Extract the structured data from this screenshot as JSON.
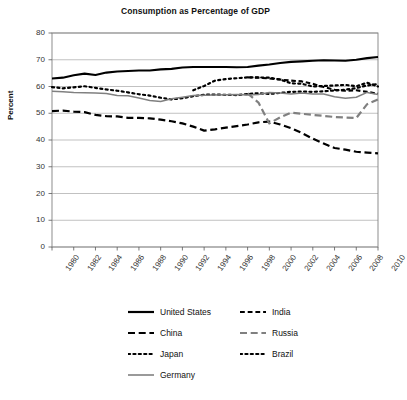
{
  "chart_data": {
    "type": "line",
    "title": "Consumption as Percentage of GDP",
    "xlabel": "",
    "ylabel": "Percent",
    "ylim": [
      0,
      80
    ],
    "ytick_step": 10,
    "yticks": [
      "0",
      "10",
      "20",
      "30",
      "40",
      "50",
      "60",
      "70",
      "80"
    ],
    "xlim": [
      1980,
      2010
    ],
    "xtick_step": 2,
    "xticks": [
      "1980",
      "1982",
      "1984",
      "1986",
      "1988",
      "1990",
      "1992",
      "1994",
      "1996",
      "1998",
      "2000",
      "2002",
      "2004",
      "2006",
      "2008",
      "2010"
    ],
    "grid": "horizontal",
    "legend_position": "below",
    "x": [
      1980,
      1981,
      1982,
      1983,
      1984,
      1985,
      1986,
      1987,
      1988,
      1989,
      1990,
      1991,
      1992,
      1993,
      1994,
      1995,
      1996,
      1997,
      1998,
      1999,
      2000,
      2001,
      2002,
      2003,
      2004,
      2005,
      2006,
      2007,
      2008,
      2009,
      2010
    ],
    "series": [
      {
        "name": "United States",
        "style": "solid",
        "color": "#000000",
        "width": 2.1,
        "values": [
          63.0,
          63.3,
          64.2,
          64.8,
          64.3,
          65.2,
          65.6,
          65.8,
          66.0,
          66.0,
          66.4,
          66.6,
          67.1,
          67.3,
          67.3,
          67.3,
          67.3,
          67.2,
          67.3,
          67.8,
          68.2,
          68.8,
          69.2,
          69.4,
          69.6,
          69.8,
          69.7,
          69.6,
          70.0,
          70.6,
          71.0
        ]
      },
      {
        "name": "India",
        "style": "dashed",
        "color": "#000000",
        "width": 2.1,
        "values": [
          null,
          null,
          null,
          null,
          null,
          null,
          null,
          null,
          null,
          null,
          null,
          null,
          null,
          null,
          null,
          null,
          null,
          null,
          63.4,
          63.3,
          63.0,
          62.6,
          62.2,
          61.9,
          61.0,
          59.8,
          58.8,
          58.4,
          58.6,
          58.0,
          57.3
        ]
      },
      {
        "name": "China",
        "style": "dashed-long",
        "color": "#000000",
        "width": 2.2,
        "values": [
          50.8,
          51.0,
          50.6,
          50.4,
          49.4,
          48.9,
          48.8,
          48.3,
          48.3,
          48.1,
          47.6,
          47.0,
          46.2,
          45.0,
          43.5,
          44.0,
          44.6,
          45.2,
          45.8,
          46.6,
          46.9,
          45.8,
          44.4,
          42.6,
          40.5,
          38.7,
          37.0,
          36.4,
          35.6,
          35.3,
          35.0
        ]
      },
      {
        "name": "Russia",
        "style": "dashed-long",
        "color": "#808080",
        "width": 2.2,
        "values": [
          null,
          null,
          null,
          null,
          null,
          null,
          null,
          null,
          null,
          null,
          null,
          null,
          null,
          null,
          null,
          null,
          null,
          null,
          57.4,
          54.0,
          46.2,
          48.5,
          50.2,
          49.8,
          49.4,
          49.0,
          48.6,
          48.4,
          48.2,
          53.4,
          55.2
        ]
      },
      {
        "name": "Japan",
        "style": "dotted",
        "color": "#000000",
        "width": 2.2,
        "values": [
          59.8,
          59.3,
          59.7,
          60.1,
          59.5,
          58.9,
          58.4,
          57.8,
          57.1,
          56.6,
          55.8,
          55.2,
          55.6,
          56.4,
          56.9,
          57.0,
          56.9,
          56.8,
          57.2,
          57.5,
          57.2,
          57.6,
          58.0,
          58.1,
          58.0,
          58.2,
          58.5,
          58.8,
          59.4,
          60.4,
          60.9
        ]
      },
      {
        "name": "Brazil",
        "style": "dotted",
        "color": "#000000",
        "width": 2.2,
        "values": [
          null,
          null,
          null,
          null,
          null,
          null,
          null,
          null,
          null,
          null,
          null,
          null,
          null,
          58.6,
          60.2,
          62.2,
          62.8,
          63.1,
          63.4,
          63.4,
          63.3,
          62.6,
          61.2,
          61.0,
          60.0,
          60.2,
          60.4,
          60.6,
          60.1,
          61.4,
          60.0
        ]
      },
      {
        "name": "Germany",
        "style": "solid",
        "color": "#808080",
        "width": 1.5,
        "values": [
          58.2,
          58.0,
          57.8,
          57.7,
          57.6,
          57.4,
          56.6,
          56.5,
          55.7,
          54.8,
          54.4,
          55.4,
          56.0,
          56.6,
          56.7,
          56.8,
          56.9,
          57.0,
          56.8,
          57.0,
          57.8,
          57.6,
          57.2,
          57.6,
          57.2,
          57.2,
          56.2,
          55.6,
          56.0,
          57.8,
          57.0
        ]
      }
    ]
  },
  "legend": {
    "rows": [
      [
        {
          "label": "United States",
          "style": "solid",
          "color": "#000000"
        },
        {
          "label": "India",
          "style": "dashed",
          "color": "#000000"
        }
      ],
      [
        {
          "label": "China",
          "style": "dashed-long",
          "color": "#000000"
        },
        {
          "label": "Russia",
          "style": "dashed-long",
          "color": "#808080"
        }
      ],
      [
        {
          "label": "Japan",
          "style": "dotted",
          "color": "#000000"
        },
        {
          "label": "Brazil",
          "style": "dotted",
          "color": "#000000"
        }
      ],
      [
        {
          "label": "Germany",
          "style": "solid",
          "color": "#808080"
        }
      ]
    ]
  },
  "caption": {
    "text": ""
  },
  "colors": {
    "axis": "#595959",
    "grid": "#a6a6a6",
    "frame": "#808080",
    "text": "#1a1a1a"
  }
}
